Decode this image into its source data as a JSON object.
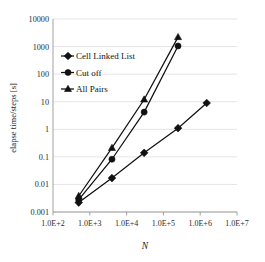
{
  "chart_data": {
    "type": "line",
    "title": "",
    "xlabel": "N",
    "ylabel": "elapse time/steps [s]",
    "xscale": "log",
    "yscale": "log",
    "xlim": [
      100,
      10000000
    ],
    "ylim": [
      0.001,
      10000
    ],
    "grid": true,
    "legend_position": "upper-left-inside",
    "x_tick_labels": [
      "1.0E+2",
      "1.0E+3",
      "1.0E+4",
      "1.0E+5",
      "1.0E+6",
      "1.0E+7"
    ],
    "x_tick_values": [
      100,
      1000,
      10000,
      100000,
      1000000,
      10000000
    ],
    "y_tick_labels": [
      "10000",
      "1000",
      "100",
      "10",
      "1",
      "0.1",
      "0.01",
      "0.001"
    ],
    "y_tick_values": [
      10000,
      1000,
      100,
      10,
      1,
      0.1,
      0.01,
      0.001
    ],
    "series": [
      {
        "name": "Cell Linked List",
        "marker": "diamond",
        "x": [
          500,
          4000,
          30000,
          250000,
          1500000
        ],
        "y": [
          0.0022,
          0.017,
          0.14,
          1.1,
          9.0
        ]
      },
      {
        "name": "Cut off",
        "marker": "circle",
        "x": [
          500,
          4000,
          30000,
          250000
        ],
        "y": [
          0.0028,
          0.082,
          4.2,
          1050
        ]
      },
      {
        "name": "All Pairs",
        "marker": "triangle",
        "x": [
          500,
          4000,
          30000,
          250000
        ],
        "y": [
          0.0038,
          0.21,
          12.0,
          2200
        ]
      }
    ]
  },
  "legend": {
    "entries": [
      {
        "label": "Cell Linked List",
        "marker": "diamond"
      },
      {
        "label": "Cut off",
        "marker": "circle"
      },
      {
        "label": "All Pairs",
        "marker": "triangle"
      }
    ]
  },
  "colors": {
    "ink": "#111111",
    "grid": "#d9d9d9",
    "axis": "#8a8a8a",
    "background": "#ffffff"
  }
}
